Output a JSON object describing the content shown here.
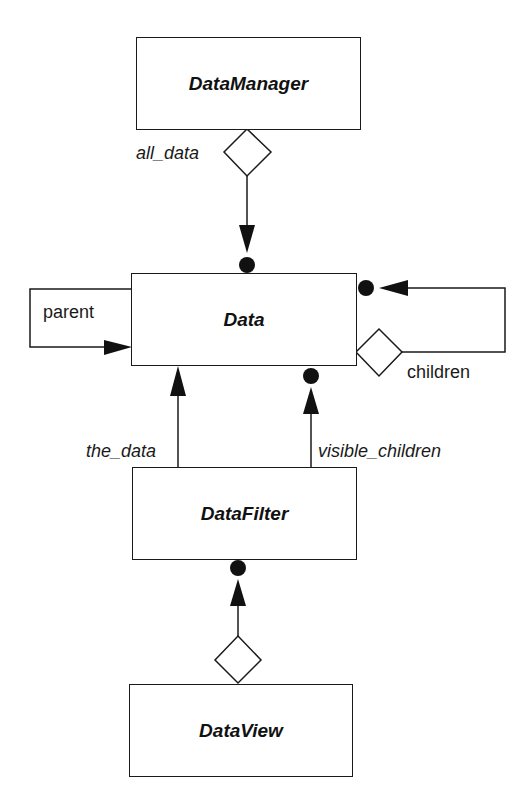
{
  "diagram": {
    "type": "class-diagram",
    "classes": [
      {
        "id": "datamanager",
        "name": "DataManager"
      },
      {
        "id": "data",
        "name": "Data"
      },
      {
        "id": "datafilter",
        "name": "DataFilter"
      },
      {
        "id": "dataview",
        "name": "DataView"
      }
    ],
    "relations": [
      {
        "from": "DataManager",
        "to": "Data",
        "label": "all_data",
        "kind": "aggregation-many"
      },
      {
        "from": "Data",
        "to": "Data",
        "label": "parent",
        "kind": "association-one"
      },
      {
        "from": "Data",
        "to": "Data",
        "label": "children",
        "kind": "aggregation-many"
      },
      {
        "from": "DataFilter",
        "to": "Data",
        "label": "the_data",
        "kind": "association-one"
      },
      {
        "from": "DataFilter",
        "to": "Data",
        "label": "visible_children",
        "kind": "association-many"
      },
      {
        "from": "DataView",
        "to": "DataFilter",
        "label": "",
        "kind": "aggregation-many"
      }
    ],
    "labels": {
      "all_data": "all_data",
      "parent": "parent",
      "children": "children",
      "the_data": "the_data",
      "visible_children": "visible_children"
    },
    "colors": {
      "stroke": "#1a1a1a",
      "fill": "#ffffff"
    }
  }
}
